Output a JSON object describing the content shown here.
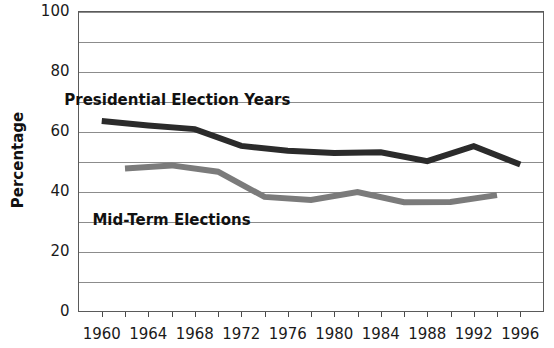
{
  "chart_data": {
    "type": "line",
    "title": "",
    "xlabel": "",
    "ylabel": "Percentage",
    "ylim": [
      0,
      100
    ],
    "xlim": [
      1958,
      1998
    ],
    "y_ticks": [
      0,
      20,
      40,
      60,
      80,
      100
    ],
    "y_tick_labels": [
      "0",
      "20",
      "40",
      "60",
      "80",
      "100"
    ],
    "y_minor_gridlines": [
      10,
      30,
      50,
      70,
      90
    ],
    "x_ticks": [
      1960,
      1962,
      1964,
      1966,
      1968,
      1970,
      1972,
      1974,
      1976,
      1978,
      1980,
      1982,
      1984,
      1986,
      1988,
      1990,
      1992,
      1994,
      1996
    ],
    "x_tick_labels": [
      "1960",
      "",
      "1964",
      "",
      "1968",
      "",
      "1972",
      "",
      "1976",
      "",
      "1980",
      "",
      "1984",
      "",
      "1988",
      "",
      "1992",
      "",
      "1996"
    ],
    "grid": true,
    "legend": "inline-annotations",
    "series": [
      {
        "name": "Presidential Election Years",
        "color": "#2b2b2b",
        "x": [
          1960,
          1964,
          1968,
          1972,
          1976,
          1980,
          1984,
          1988,
          1992,
          1996
        ],
        "values": [
          63.5,
          62.0,
          60.8,
          55.2,
          53.6,
          52.8,
          53.1,
          50.1,
          55.1,
          49.0
        ],
        "label_text": "Presidential Election Years",
        "label_x": 1966.5,
        "label_y": 70.5
      },
      {
        "name": "Mid-Term Elections",
        "color": "#7b7b7b",
        "x": [
          1962,
          1966,
          1970,
          1974,
          1978,
          1982,
          1986,
          1990,
          1994
        ],
        "values": [
          47.7,
          48.7,
          46.6,
          38.2,
          37.2,
          39.8,
          36.4,
          36.5,
          38.8
        ],
        "label_text": "Mid-Term Elections",
        "label_x": 1966.0,
        "label_y": 30.5
      }
    ]
  }
}
